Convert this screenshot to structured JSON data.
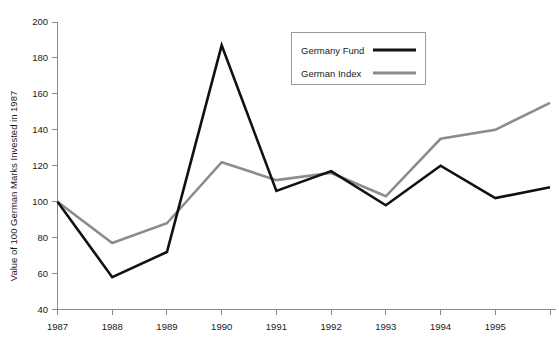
{
  "chart_data": {
    "type": "line",
    "title": "",
    "xlabel": "",
    "ylabel": "Value of 100 German Marks Invested in 1987",
    "x": [
      1987,
      1988,
      1989,
      1990,
      1991,
      1992,
      1993,
      1994,
      1995,
      1996
    ],
    "categories": [
      "1987",
      "1988",
      "1989",
      "1990",
      "1991",
      "1992",
      "1993",
      "1994",
      "1995",
      ""
    ],
    "xtick_labels": [
      "1987",
      "1988",
      "1989",
      "1990",
      "1991",
      "1992",
      "1993",
      "1994",
      "1995"
    ],
    "ytick_labels": [
      "40",
      "60",
      "80",
      "100",
      "120",
      "140",
      "160",
      "180",
      "200"
    ],
    "ytick_values": [
      40,
      60,
      80,
      100,
      120,
      140,
      160,
      180,
      200
    ],
    "ylim": [
      40,
      200
    ],
    "xlim": [
      1987,
      1996
    ],
    "grid": false,
    "legend_position": "top-right",
    "series": [
      {
        "name": "Germany Fund",
        "color": "#111111",
        "linewidth": 2.6,
        "values": [
          100,
          58,
          72,
          187,
          106,
          117,
          98,
          120,
          102,
          108
        ]
      },
      {
        "name": "German Index",
        "color": "#8c8c8c",
        "linewidth": 2.6,
        "values": [
          100,
          77,
          88,
          122,
          112,
          116,
          103,
          135,
          140,
          155
        ]
      }
    ]
  },
  "legend": {
    "entries": [
      {
        "label": "Germany Fund",
        "color": "#111111"
      },
      {
        "label": "German Index",
        "color": "#8c8c8c"
      }
    ]
  },
  "axes": {
    "y_title": "Value of 100 German Marks Invested in 1987",
    "axis_color": "#8a8a8a"
  }
}
